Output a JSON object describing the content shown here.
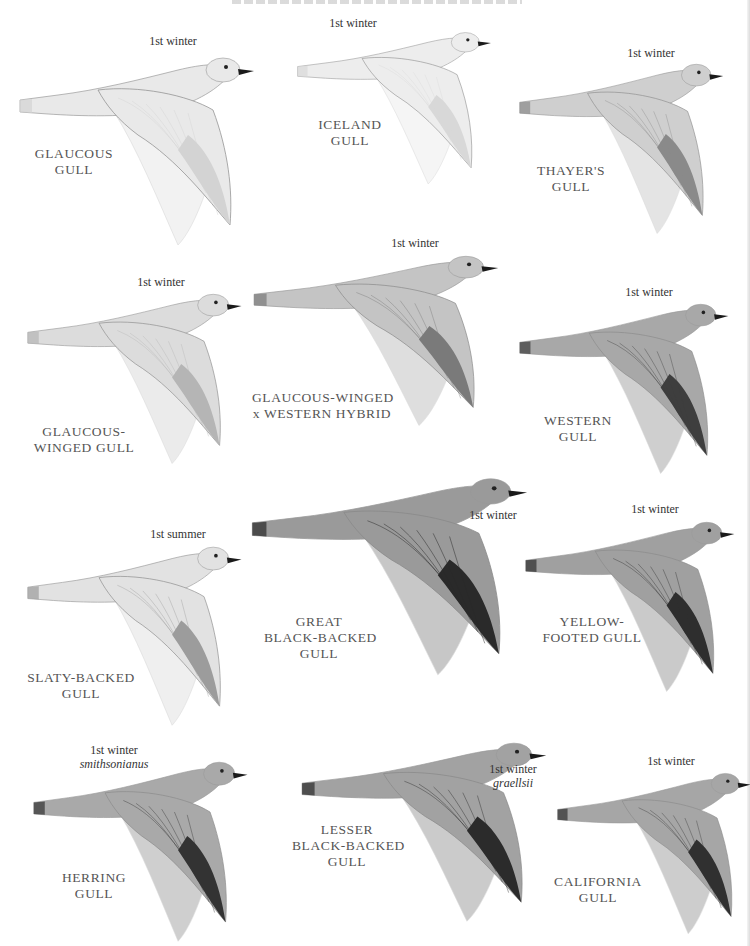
{
  "page": {
    "plates": [
      {
        "id": "glaucous",
        "name_lines": [
          "GLAUCOUS",
          "GULL"
        ],
        "age": "1st winter",
        "subspecies": null,
        "tone": "#e9e9e9",
        "dark": "#d3d3d3"
      },
      {
        "id": "iceland",
        "name_lines": [
          "ICELAND",
          "GULL"
        ],
        "age": "1st winter",
        "subspecies": null,
        "tone": "#ededed",
        "dark": "#d8d8d8"
      },
      {
        "id": "thayers",
        "name_lines": [
          "THAYER'S",
          "GULL"
        ],
        "age": "1st winter",
        "subspecies": null,
        "tone": "#cfcfcf",
        "dark": "#8a8a8a"
      },
      {
        "id": "glaucous-winged",
        "name_lines": [
          "GLAUCOUS-",
          "WINGED GULL"
        ],
        "age": "1st winter",
        "subspecies": null,
        "tone": "#dcdcdc",
        "dark": "#b5b5b5"
      },
      {
        "id": "glaucous-winged-x-western",
        "name_lines": [
          "GLAUCOUS-WINGED",
          "x WESTERN HYBRID"
        ],
        "age": "1st winter",
        "subspecies": null,
        "tone": "#c4c4c4",
        "dark": "#7a7a7a"
      },
      {
        "id": "western",
        "name_lines": [
          "WESTERN",
          "GULL"
        ],
        "age": "1st winter",
        "subspecies": null,
        "tone": "#a8a8a8",
        "dark": "#3e3e3e"
      },
      {
        "id": "slaty-backed",
        "name_lines": [
          "SLATY-BACKED",
          "GULL"
        ],
        "age": "1st summer",
        "subspecies": null,
        "tone": "#e2e2e2",
        "dark": "#9c9c9c"
      },
      {
        "id": "great-black-backed",
        "name_lines": [
          "GREAT",
          "BLACK-BACKED",
          "GULL"
        ],
        "age": "1st winter",
        "subspecies": null,
        "tone": "#9a9a9a",
        "dark": "#2a2a2a"
      },
      {
        "id": "yellow-footed",
        "name_lines": [
          "YELLOW-",
          "FOOTED GULL"
        ],
        "age": "1st winter",
        "subspecies": null,
        "tone": "#a0a0a0",
        "dark": "#2e2e2e"
      },
      {
        "id": "herring",
        "name_lines": [
          "HERRING",
          "GULL"
        ],
        "age": "1st winter",
        "subspecies": "smithsonianus",
        "tone": "#a9a9a9",
        "dark": "#333333"
      },
      {
        "id": "lesser-black-backed",
        "name_lines": [
          "LESSER",
          "BLACK-BACKED",
          "GULL"
        ],
        "age": "1st winter",
        "subspecies": "graellsii",
        "tone": "#a2a2a2",
        "dark": "#2b2b2b"
      },
      {
        "id": "california",
        "name_lines": [
          "CALIFORNIA",
          "GULL"
        ],
        "age": "1st winter",
        "subspecies": null,
        "tone": "#a6a6a6",
        "dark": "#303030"
      }
    ]
  }
}
